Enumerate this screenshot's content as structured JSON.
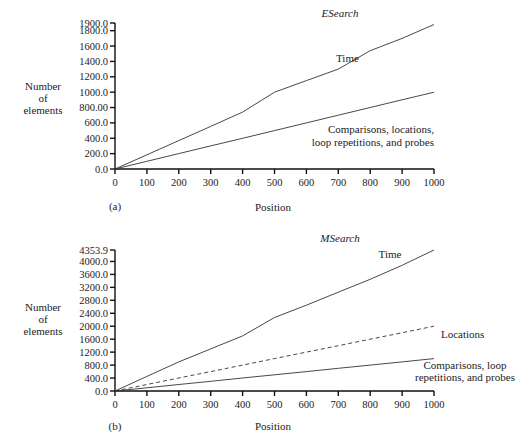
{
  "chart_data": [
    {
      "panel": "(a)",
      "type": "line",
      "title": "ESearch",
      "xlabel": "Position",
      "ylabel": "Number of elements",
      "xlim": [
        0,
        1000
      ],
      "ylim": [
        0,
        1900
      ],
      "x_ticks": [
        "0",
        "100",
        "200",
        "300",
        "400",
        "500",
        "600",
        "700",
        "800",
        "900",
        "1000"
      ],
      "y_ticks": [
        "0.0",
        "200.0",
        "400.0",
        "600.0",
        "800.00",
        "1000.0",
        "1200.0",
        "1400.0",
        "1600.0",
        "1800.0",
        "1900.0"
      ],
      "grid": false,
      "x": [
        0,
        100,
        200,
        300,
        400,
        500,
        600,
        700,
        800,
        900,
        1000
      ],
      "series": [
        {
          "name": "Time",
          "style": "solid",
          "values": [
            0,
            185,
            370,
            555,
            740,
            1000,
            1150,
            1300,
            1540,
            1700,
            1880
          ]
        },
        {
          "name": "Comparisons, locations, loop repetitions, and probes",
          "style": "solid",
          "values": [
            0,
            100,
            200,
            300,
            400,
            500,
            600,
            700,
            800,
            900,
            1000
          ]
        }
      ],
      "annotations": [
        {
          "text": "Time"
        },
        {
          "text": "Comparisons, locations,"
        },
        {
          "text": "loop repetitions, and probes"
        }
      ]
    },
    {
      "panel": "(b)",
      "type": "line",
      "title": "MSearch",
      "xlabel": "Position",
      "ylabel": "Number of elements",
      "xlim": [
        0,
        1000
      ],
      "ylim": [
        0,
        4353.9
      ],
      "x_ticks": [
        "0",
        "100",
        "200",
        "300",
        "400",
        "500",
        "600",
        "700",
        "800",
        "900",
        "1000"
      ],
      "y_ticks": [
        "0.0",
        "400.0",
        "800.0",
        "1200.0",
        "1600.0",
        "2000.0",
        "2400.0",
        "2800.0",
        "3200.0",
        "3600.0",
        "4000.0",
        "4353.9"
      ],
      "grid": false,
      "x": [
        0,
        100,
        200,
        300,
        400,
        500,
        600,
        700,
        800,
        900,
        1000
      ],
      "series": [
        {
          "name": "Time",
          "style": "solid",
          "values": [
            0,
            450,
            900,
            1300,
            1700,
            2270,
            2650,
            3050,
            3450,
            3880,
            4353.9
          ]
        },
        {
          "name": "Locations",
          "style": "dashed",
          "values": [
            0,
            200,
            400,
            600,
            800,
            1000,
            1200,
            1400,
            1600,
            1800,
            2000
          ]
        },
        {
          "name": "Comparisons, loop repetitions, and probes",
          "style": "solid",
          "values": [
            0,
            100,
            200,
            300,
            400,
            500,
            600,
            700,
            800,
            900,
            1000
          ]
        }
      ],
      "annotations": [
        {
          "text": "Time"
        },
        {
          "text": "Locations"
        },
        {
          "text": "Comparisons, loop"
        },
        {
          "text": "repetitions, and probes"
        }
      ]
    }
  ],
  "panels": {
    "a": {
      "label": "(a)",
      "title": "ESearch",
      "xlabel": "Position",
      "ylabel_lines": [
        "Number",
        "of",
        "elements"
      ],
      "annot_time": "Time",
      "annot_comp_1": "Comparisons, locations,",
      "annot_comp_2": "loop repetitions, and probes"
    },
    "b": {
      "label": "(b)",
      "title": "MSearch",
      "xlabel": "Position",
      "ylabel_lines": [
        "Number",
        "of",
        "elements"
      ],
      "annot_time": "Time",
      "annot_loc": "Locations",
      "annot_comp_1": "Comparisons, loop",
      "annot_comp_2": "repetitions, and probes"
    }
  }
}
